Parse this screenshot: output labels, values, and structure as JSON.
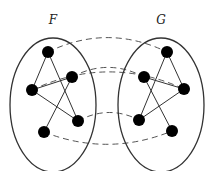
{
  "diagram": {
    "type": "graph-isomorphism",
    "graphs": [
      {
        "id": "F",
        "label": "F",
        "label_pos": [
          53,
          24
        ],
        "ellipse": {
          "cx": 53,
          "cy": 105,
          "rx": 43,
          "ry": 67
        },
        "nodes": [
          {
            "id": "F1",
            "x": 48,
            "y": 52
          },
          {
            "id": "F2",
            "x": 72,
            "y": 77
          },
          {
            "id": "F3",
            "x": 32,
            "y": 90
          },
          {
            "id": "F4",
            "x": 78,
            "y": 121
          },
          {
            "id": "F5",
            "x": 44,
            "y": 132
          }
        ],
        "edges": [
          [
            "F3",
            "F1"
          ],
          [
            "F1",
            "F4"
          ],
          [
            "F3",
            "F2"
          ],
          [
            "F3",
            "F4"
          ],
          [
            "F2",
            "F5"
          ]
        ]
      },
      {
        "id": "G",
        "label": "G",
        "label_pos": [
          161,
          24
        ],
        "ellipse": {
          "cx": 161,
          "cy": 105,
          "rx": 43,
          "ry": 67
        },
        "nodes": [
          {
            "id": "G1",
            "x": 167,
            "y": 52
          },
          {
            "id": "G2",
            "x": 144,
            "y": 77
          },
          {
            "id": "G3",
            "x": 184,
            "y": 89
          },
          {
            "id": "G4",
            "x": 139,
            "y": 120
          },
          {
            "id": "G5",
            "x": 172,
            "y": 131
          }
        ],
        "edges": [
          [
            "G1",
            "G3"
          ],
          [
            "G1",
            "G4"
          ],
          [
            "G2",
            "G3"
          ],
          [
            "G4",
            "G3"
          ],
          [
            "G2",
            "G5"
          ]
        ]
      }
    ],
    "mappings": [
      {
        "from": "F1",
        "to": "G1",
        "bend": -18
      },
      {
        "from": "F3",
        "to": "G3",
        "bend": -22
      },
      {
        "from": "F2",
        "to": "G2",
        "bend": -12
      },
      {
        "from": "F4",
        "to": "G4",
        "bend": -10
      },
      {
        "from": "F5",
        "to": "G5",
        "bend": 16
      }
    ],
    "colors": {
      "node": "#000000",
      "edge": "#333333",
      "ellipse": "#333333",
      "mapping": "#555555"
    }
  }
}
